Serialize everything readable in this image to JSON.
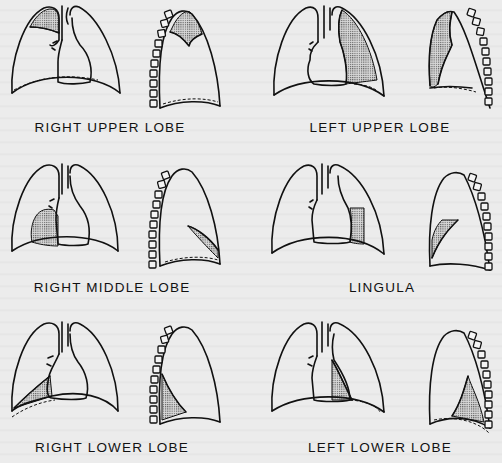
{
  "figure": {
    "panels": [
      {
        "id": "right-upper-lobe",
        "label": "RIGHT UPPER LOBE",
        "side": "right",
        "views": [
          "frontal",
          "lateral"
        ],
        "shaded_region": "upper right lung apex"
      },
      {
        "id": "left-upper-lobe",
        "label": "LEFT UPPER LOBE",
        "side": "left",
        "views": [
          "frontal",
          "lateral"
        ],
        "shaded_region": "upper left lung along heart border"
      },
      {
        "id": "right-middle-lobe",
        "label": "RIGHT MIDDLE LOBE",
        "side": "right",
        "views": [
          "frontal",
          "lateral"
        ],
        "shaded_region": "right lower heart border"
      },
      {
        "id": "lingula",
        "label": "LINGULA",
        "side": "left",
        "views": [
          "frontal",
          "lateral"
        ],
        "shaded_region": "left heart border, anterior lateral wedge"
      },
      {
        "id": "right-lower-lobe",
        "label": "RIGHT LOWER LOBE",
        "side": "right",
        "views": [
          "frontal",
          "lateral"
        ],
        "shaded_region": "right costophrenic base"
      },
      {
        "id": "left-lower-lobe",
        "label": "LEFT LOWER LOBE",
        "side": "left",
        "views": [
          "frontal",
          "lateral"
        ],
        "shaded_region": "retrocardiac left base"
      }
    ]
  },
  "colors": {
    "ink": "#111111",
    "paper": "#ececec",
    "shading": "#555555"
  }
}
